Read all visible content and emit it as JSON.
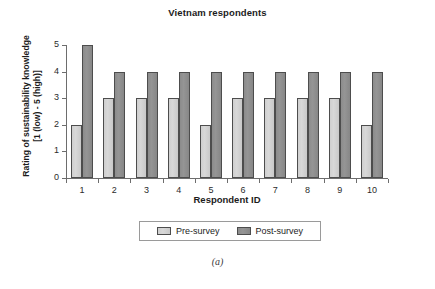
{
  "chart_data": {
    "type": "bar",
    "title": "Vietnam respondents",
    "xlabel": "Respondent ID",
    "ylabel_line1": "Rating of sustainability knowledge",
    "ylabel_line2": "[1 (low) - 5 (high)]",
    "categories": [
      "1",
      "2",
      "3",
      "4",
      "5",
      "6",
      "7",
      "8",
      "9",
      "10"
    ],
    "series": [
      {
        "name": "Pre-survey",
        "color": "#d4d4d4",
        "values": [
          2,
          3,
          3,
          3,
          2,
          3,
          3,
          3,
          3,
          2
        ]
      },
      {
        "name": "Post-survey",
        "color": "#909090",
        "values": [
          5,
          4,
          4,
          4,
          4,
          4,
          4,
          4,
          4,
          4
        ]
      }
    ],
    "ylim": [
      0,
      5
    ],
    "yticks": [
      0,
      1,
      2,
      3,
      4,
      5
    ],
    "ytick_labels": [
      "0",
      "1",
      "2",
      "3",
      "4",
      "5"
    ],
    "grid": false,
    "legend_position": "bottom"
  },
  "caption": "(a)"
}
